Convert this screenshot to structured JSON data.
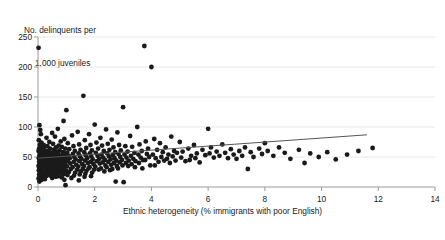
{
  "chart_data": {
    "type": "scatter",
    "title": "",
    "ylabel": "No. delinquents per\n1,000 juveniles",
    "ylabel_line1": "No. delinquents per",
    "ylabel_line2": "1,000 juveniles",
    "xlabel": "Ethnic heterogeneity (% immigrants with poor English)",
    "xlim": [
      0,
      14
    ],
    "ylim": [
      0,
      250
    ],
    "xticks": [
      0,
      2,
      4,
      6,
      8,
      10,
      12,
      14
    ],
    "xtick_labels": [
      "0",
      "2",
      "4",
      "6",
      "8",
      "10",
      "12",
      "14"
    ],
    "yticks": [
      0,
      50,
      100,
      150,
      200,
      250
    ],
    "ytick_labels": [
      "0",
      "50",
      "100",
      "150",
      "200",
      "250"
    ],
    "grid": "horizontal",
    "grid_color": "#e8e8e8",
    "axis_color": "#9a9a9a",
    "marker_color": "#1a1a1a",
    "marker_size": 2.4,
    "legend": "none",
    "trend_line": {
      "color": "#555555",
      "width": 1.0,
      "x_start": 0.0,
      "y_start": 48,
      "x_end": 11.6,
      "y_end": 87
    },
    "points": [
      [
        0.02,
        232
      ],
      [
        0.05,
        103
      ],
      [
        0.08,
        95
      ],
      [
        0.03,
        78
      ],
      [
        0.06,
        70
      ],
      [
        0.04,
        64
      ],
      [
        0.02,
        60
      ],
      [
        0.07,
        56
      ],
      [
        0.05,
        52
      ],
      [
        0.03,
        48
      ],
      [
        0.08,
        45
      ],
      [
        0.04,
        42
      ],
      [
        0.06,
        38
      ],
      [
        0.02,
        35
      ],
      [
        0.05,
        31
      ],
      [
        0.03,
        28
      ],
      [
        0.07,
        25
      ],
      [
        0.04,
        21
      ],
      [
        0.06,
        18
      ],
      [
        0.02,
        14
      ],
      [
        0.05,
        9
      ],
      [
        0.1,
        88
      ],
      [
        0.12,
        74
      ],
      [
        0.15,
        66
      ],
      [
        0.11,
        61
      ],
      [
        0.14,
        57
      ],
      [
        0.17,
        53
      ],
      [
        0.13,
        49
      ],
      [
        0.16,
        45
      ],
      [
        0.12,
        41
      ],
      [
        0.18,
        37
      ],
      [
        0.15,
        33
      ],
      [
        0.11,
        29
      ],
      [
        0.19,
        25
      ],
      [
        0.14,
        21
      ],
      [
        0.16,
        17
      ],
      [
        0.13,
        12
      ],
      [
        0.2,
        70
      ],
      [
        0.22,
        63
      ],
      [
        0.25,
        58
      ],
      [
        0.21,
        54
      ],
      [
        0.24,
        50
      ],
      [
        0.27,
        46
      ],
      [
        0.23,
        42
      ],
      [
        0.26,
        38
      ],
      [
        0.22,
        34
      ],
      [
        0.28,
        30
      ],
      [
        0.25,
        26
      ],
      [
        0.21,
        22
      ],
      [
        0.29,
        18
      ],
      [
        0.24,
        13
      ],
      [
        0.3,
        82
      ],
      [
        0.33,
        68
      ],
      [
        0.36,
        60
      ],
      [
        0.32,
        55
      ],
      [
        0.35,
        51
      ],
      [
        0.38,
        47
      ],
      [
        0.34,
        43
      ],
      [
        0.37,
        39
      ],
      [
        0.31,
        35
      ],
      [
        0.39,
        31
      ],
      [
        0.36,
        27
      ],
      [
        0.33,
        23
      ],
      [
        0.4,
        75
      ],
      [
        0.43,
        64
      ],
      [
        0.46,
        57
      ],
      [
        0.42,
        53
      ],
      [
        0.45,
        49
      ],
      [
        0.48,
        45
      ],
      [
        0.44,
        40
      ],
      [
        0.47,
        36
      ],
      [
        0.41,
        32
      ],
      [
        0.49,
        28
      ],
      [
        0.45,
        24
      ],
      [
        0.43,
        19
      ],
      [
        0.5,
        90
      ],
      [
        0.53,
        72
      ],
      [
        0.56,
        62
      ],
      [
        0.52,
        56
      ],
      [
        0.55,
        50
      ],
      [
        0.58,
        46
      ],
      [
        0.54,
        42
      ],
      [
        0.57,
        38
      ],
      [
        0.51,
        33
      ],
      [
        0.59,
        29
      ],
      [
        0.55,
        25
      ],
      [
        0.53,
        20
      ],
      [
        0.5,
        15
      ],
      [
        0.6,
        84
      ],
      [
        0.63,
        66
      ],
      [
        0.66,
        59
      ],
      [
        0.62,
        54
      ],
      [
        0.65,
        48
      ],
      [
        0.68,
        44
      ],
      [
        0.64,
        40
      ],
      [
        0.67,
        35
      ],
      [
        0.61,
        31
      ],
      [
        0.69,
        27
      ],
      [
        0.65,
        22
      ],
      [
        0.63,
        17
      ],
      [
        0.7,
        97
      ],
      [
        0.73,
        69
      ],
      [
        0.76,
        61
      ],
      [
        0.72,
        55
      ],
      [
        0.75,
        50
      ],
      [
        0.78,
        45
      ],
      [
        0.74,
        41
      ],
      [
        0.77,
        36
      ],
      [
        0.71,
        32
      ],
      [
        0.79,
        28
      ],
      [
        0.75,
        23
      ],
      [
        0.72,
        18
      ],
      [
        0.8,
        76
      ],
      [
        0.84,
        67
      ],
      [
        0.88,
        58
      ],
      [
        0.82,
        52
      ],
      [
        0.86,
        47
      ],
      [
        0.89,
        43
      ],
      [
        0.83,
        39
      ],
      [
        0.87,
        34
      ],
      [
        0.81,
        30
      ],
      [
        0.85,
        26
      ],
      [
        0.88,
        21
      ],
      [
        0.84,
        16
      ],
      [
        0.9,
        110
      ],
      [
        0.93,
        80
      ],
      [
        0.96,
        64
      ],
      [
        0.92,
        56
      ],
      [
        0.95,
        51
      ],
      [
        0.98,
        46
      ],
      [
        0.94,
        41
      ],
      [
        0.97,
        37
      ],
      [
        0.91,
        32
      ],
      [
        0.99,
        27
      ],
      [
        0.95,
        22
      ],
      [
        0.93,
        12
      ],
      [
        0.97,
        3
      ],
      [
        1.0,
        128
      ],
      [
        1.05,
        73
      ],
      [
        1.1,
        63
      ],
      [
        1.03,
        57
      ],
      [
        1.08,
        52
      ],
      [
        1.12,
        48
      ],
      [
        1.06,
        43
      ],
      [
        1.14,
        39
      ],
      [
        1.02,
        34
      ],
      [
        1.16,
        30
      ],
      [
        1.09,
        25
      ],
      [
        1.04,
        20
      ],
      [
        1.18,
        15
      ],
      [
        1.2,
        86
      ],
      [
        1.25,
        68
      ],
      [
        1.3,
        60
      ],
      [
        1.23,
        55
      ],
      [
        1.28,
        50
      ],
      [
        1.33,
        46
      ],
      [
        1.26,
        42
      ],
      [
        1.35,
        37
      ],
      [
        1.22,
        33
      ],
      [
        1.38,
        29
      ],
      [
        1.31,
        24
      ],
      [
        1.27,
        19
      ],
      [
        1.4,
        92
      ],
      [
        1.45,
        71
      ],
      [
        1.5,
        62
      ],
      [
        1.43,
        56
      ],
      [
        1.48,
        51
      ],
      [
        1.53,
        47
      ],
      [
        1.46,
        43
      ],
      [
        1.56,
        38
      ],
      [
        1.42,
        34
      ],
      [
        1.58,
        30
      ],
      [
        1.51,
        26
      ],
      [
        1.47,
        21
      ],
      [
        1.44,
        11
      ],
      [
        1.6,
        152
      ],
      [
        1.65,
        78
      ],
      [
        1.7,
        65
      ],
      [
        1.63,
        58
      ],
      [
        1.68,
        53
      ],
      [
        1.73,
        48
      ],
      [
        1.66,
        44
      ],
      [
        1.76,
        40
      ],
      [
        1.62,
        35
      ],
      [
        1.78,
        31
      ],
      [
        1.71,
        27
      ],
      [
        1.67,
        22
      ],
      [
        1.64,
        17
      ],
      [
        1.8,
        88
      ],
      [
        1.85,
        70
      ],
      [
        1.9,
        61
      ],
      [
        1.83,
        56
      ],
      [
        1.88,
        51
      ],
      [
        1.93,
        46
      ],
      [
        1.86,
        42
      ],
      [
        1.96,
        38
      ],
      [
        1.82,
        33
      ],
      [
        1.98,
        29
      ],
      [
        1.91,
        24
      ],
      [
        1.87,
        18
      ],
      [
        2.0,
        104
      ],
      [
        2.06,
        74
      ],
      [
        2.12,
        64
      ],
      [
        2.04,
        57
      ],
      [
        2.1,
        52
      ],
      [
        2.16,
        47
      ],
      [
        2.08,
        43
      ],
      [
        2.18,
        39
      ],
      [
        2.02,
        34
      ],
      [
        2.14,
        29
      ],
      [
        2.2,
        82
      ],
      [
        2.26,
        69
      ],
      [
        2.32,
        60
      ],
      [
        2.24,
        54
      ],
      [
        2.3,
        49
      ],
      [
        2.36,
        45
      ],
      [
        2.28,
        41
      ],
      [
        2.38,
        36
      ],
      [
        2.22,
        31
      ],
      [
        2.34,
        26
      ],
      [
        2.4,
        96
      ],
      [
        2.46,
        72
      ],
      [
        2.52,
        62
      ],
      [
        2.44,
        56
      ],
      [
        2.5,
        51
      ],
      [
        2.56,
        46
      ],
      [
        2.48,
        42
      ],
      [
        2.58,
        37
      ],
      [
        2.42,
        33
      ],
      [
        2.54,
        28
      ],
      [
        2.6,
        79
      ],
      [
        2.66,
        66
      ],
      [
        2.72,
        58
      ],
      [
        2.64,
        53
      ],
      [
        2.7,
        48
      ],
      [
        2.76,
        44
      ],
      [
        2.68,
        40
      ],
      [
        2.78,
        35
      ],
      [
        2.62,
        30
      ],
      [
        2.74,
        9
      ],
      [
        2.8,
        91
      ],
      [
        2.86,
        70
      ],
      [
        2.92,
        61
      ],
      [
        2.84,
        55
      ],
      [
        2.9,
        50
      ],
      [
        2.96,
        45
      ],
      [
        2.88,
        41
      ],
      [
        2.98,
        36
      ],
      [
        2.82,
        31
      ],
      [
        3.0,
        133
      ],
      [
        3.08,
        68
      ],
      [
        3.16,
        59
      ],
      [
        3.05,
        54
      ],
      [
        3.12,
        49
      ],
      [
        3.2,
        44
      ],
      [
        3.1,
        40
      ],
      [
        3.18,
        35
      ],
      [
        3.02,
        8
      ],
      [
        3.25,
        85
      ],
      [
        3.32,
        67
      ],
      [
        3.4,
        57
      ],
      [
        3.28,
        52
      ],
      [
        3.36,
        47
      ],
      [
        3.44,
        43
      ],
      [
        3.3,
        38
      ],
      [
        3.42,
        33
      ],
      [
        3.5,
        100
      ],
      [
        3.58,
        71
      ],
      [
        3.66,
        60
      ],
      [
        3.54,
        54
      ],
      [
        3.62,
        49
      ],
      [
        3.7,
        45
      ],
      [
        3.56,
        40
      ],
      [
        3.68,
        31
      ],
      [
        3.75,
        235
      ],
      [
        3.8,
        76
      ],
      [
        3.88,
        64
      ],
      [
        3.84,
        55
      ],
      [
        3.92,
        50
      ],
      [
        3.78,
        45
      ],
      [
        3.96,
        36
      ],
      [
        4.0,
        200
      ],
      [
        4.1,
        80
      ],
      [
        4.2,
        62
      ],
      [
        4.05,
        54
      ],
      [
        4.15,
        48
      ],
      [
        4.25,
        42
      ],
      [
        4.12,
        36
      ],
      [
        4.3,
        73
      ],
      [
        4.4,
        58
      ],
      [
        4.35,
        50
      ],
      [
        4.45,
        44
      ],
      [
        4.5,
        66
      ],
      [
        4.6,
        54
      ],
      [
        4.55,
        47
      ],
      [
        4.65,
        40
      ],
      [
        4.7,
        84
      ],
      [
        4.8,
        60
      ],
      [
        4.75,
        51
      ],
      [
        4.85,
        44
      ],
      [
        4.9,
        57
      ],
      [
        5.0,
        75
      ],
      [
        5.1,
        59
      ],
      [
        5.05,
        49
      ],
      [
        5.2,
        43
      ],
      [
        5.3,
        64
      ],
      [
        5.4,
        52
      ],
      [
        5.35,
        45
      ],
      [
        5.5,
        70
      ],
      [
        5.6,
        56
      ],
      [
        5.55,
        48
      ],
      [
        5.7,
        41
      ],
      [
        5.8,
        62
      ],
      [
        5.9,
        53
      ],
      [
        6.0,
        97
      ],
      [
        6.1,
        66
      ],
      [
        6.05,
        56
      ],
      [
        6.2,
        49
      ],
      [
        6.3,
        59
      ],
      [
        6.4,
        52
      ],
      [
        6.5,
        71
      ],
      [
        6.6,
        57
      ],
      [
        6.7,
        48
      ],
      [
        6.8,
        63
      ],
      [
        6.9,
        54
      ],
      [
        7.0,
        47
      ],
      [
        7.1,
        60
      ],
      [
        7.2,
        52
      ],
      [
        7.3,
        66
      ],
      [
        7.4,
        30
      ],
      [
        7.5,
        58
      ],
      [
        7.6,
        50
      ],
      [
        7.8,
        64
      ],
      [
        7.9,
        55
      ],
      [
        8.0,
        73
      ],
      [
        8.1,
        60
      ],
      [
        8.3,
        52
      ],
      [
        8.5,
        66
      ],
      [
        8.7,
        57
      ],
      [
        8.9,
        47
      ],
      [
        9.2,
        62
      ],
      [
        9.4,
        40
      ],
      [
        9.6,
        56
      ],
      [
        9.9,
        50
      ],
      [
        10.2,
        58
      ],
      [
        10.5,
        46
      ],
      [
        10.9,
        54
      ],
      [
        11.3,
        60
      ],
      [
        11.8,
        65
      ]
    ]
  }
}
